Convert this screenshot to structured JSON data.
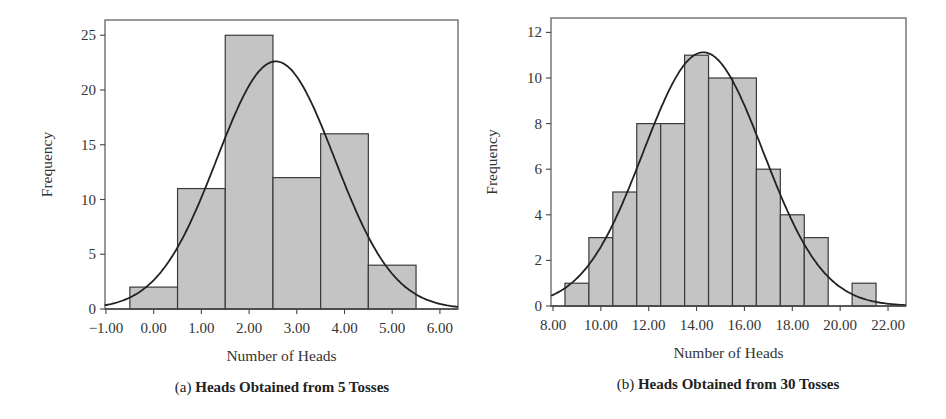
{
  "chart_data": [
    {
      "id": "a",
      "type": "bar",
      "subtype": "histogram-with-normal-curve",
      "caption_prefix": "(a)",
      "title": "Heads Obtained from 5 Tosses",
      "xlabel": "Number of Heads",
      "ylabel": "Frequency",
      "categories": [
        0,
        1,
        2,
        3,
        4,
        5
      ],
      "values": [
        2,
        11,
        25,
        12,
        16,
        4
      ],
      "bin_width": 1,
      "x_ticks": [
        "-1.00",
        "0.00",
        "1.00",
        "2.00",
        "3.00",
        "4.00",
        "5.00",
        "6.00"
      ],
      "x_tick_values": [
        -1,
        0,
        1,
        2,
        3,
        4,
        5,
        6
      ],
      "y_ticks": [
        0,
        5,
        10,
        15,
        20,
        25
      ],
      "xlim": [
        -1.05,
        6.4
      ],
      "ylim": [
        0,
        26.4
      ],
      "normal_curve": {
        "mean": 2.56,
        "sd": 1.235,
        "n": 70
      },
      "grid": false,
      "legend": null
    },
    {
      "id": "b",
      "type": "bar",
      "subtype": "histogram-with-normal-curve",
      "caption_prefix": "(b)",
      "title": "Heads Obtained from 30 Tosses",
      "xlabel": "Number of Heads",
      "ylabel": "Frequency",
      "categories": [
        9,
        10,
        11,
        12,
        13,
        14,
        15,
        16,
        17,
        18,
        19,
        20,
        21
      ],
      "values": [
        1,
        3,
        5,
        8,
        8,
        11,
        10,
        10,
        6,
        4,
        3,
        0,
        1
      ],
      "bin_width": 1,
      "x_ticks": [
        "8.00",
        "10.00",
        "12.00",
        "14.00",
        "16.00",
        "18.00",
        "20.00",
        "22.00"
      ],
      "x_tick_values": [
        8,
        10,
        12,
        14,
        16,
        18,
        20,
        22
      ],
      "y_ticks": [
        0,
        2,
        4,
        6,
        8,
        10,
        12
      ],
      "xlim": [
        7.92,
        22.75
      ],
      "ylim": [
        0,
        12.6
      ],
      "normal_curve": {
        "mean": 14.28,
        "sd": 2.51,
        "n": 70
      },
      "grid": false,
      "legend": null
    }
  ],
  "colors": {
    "bar_fill": "#c4c4c4",
    "bar_stroke": "#3a3a3a",
    "curve": "#222222",
    "frame": "#555555"
  }
}
